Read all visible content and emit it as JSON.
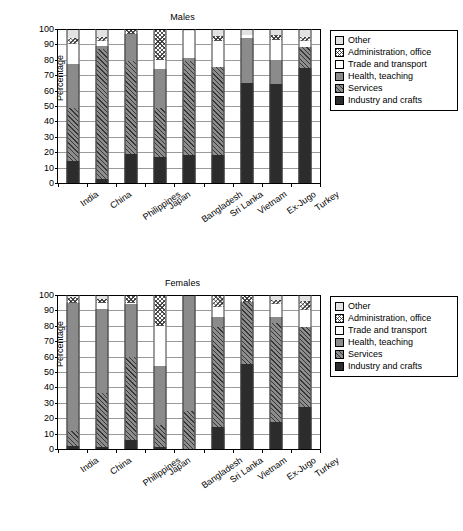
{
  "figure": {
    "width": 463,
    "height": 531
  },
  "legend": {
    "position": "right",
    "items": [
      {
        "label": "Other",
        "key": "other",
        "swatch": "other-swatch"
      },
      {
        "label": "Administration, office",
        "key": "admin",
        "swatch": "admin-swatch"
      },
      {
        "label": "Trade and transport",
        "key": "trade",
        "swatch": "trade-swatch"
      },
      {
        "label": "Health, teaching",
        "key": "health",
        "swatch": "health-swatch"
      },
      {
        "label": "Services",
        "key": "services",
        "swatch": "services-swatch"
      },
      {
        "label": "Industry and crafts",
        "key": "industry",
        "swatch": "industry-swatch"
      }
    ]
  },
  "axis": {
    "ylabel": "Percentage",
    "yticks": [
      0,
      10,
      20,
      30,
      40,
      50,
      60,
      70,
      80,
      90,
      100
    ],
    "ylim": [
      0,
      100
    ],
    "grid": true
  },
  "colors": {
    "industry": "#2c2c2c",
    "services": "#8d8d8d",
    "health": "#8b8b8b",
    "trade": "#ffffff",
    "admin": "#ffffff",
    "other": "#e2e2e2",
    "axis": "#000000",
    "grid": "#9a9a9a"
  },
  "chart_data": [
    {
      "type": "bar",
      "stacked": true,
      "title": "Males",
      "xlabel": "",
      "ylabel": "Percentage",
      "ylim": [
        0,
        100
      ],
      "grid": true,
      "legend_position": "right",
      "categories": [
        "India",
        "China",
        "Philippines",
        "Japan",
        "Bangladesh",
        "Sri Lanka",
        "Vietnam",
        "Ex-Jugo",
        "Turkey"
      ],
      "series": [
        {
          "name": "Industry and crafts",
          "values": [
            14,
            2.5,
            19,
            17,
            18,
            18,
            65,
            64,
            75
          ]
        },
        {
          "name": "Services",
          "values": [
            35,
            84.5,
            60,
            32,
            61,
            57.5,
            0,
            0,
            13
          ]
        },
        {
          "name": "Health, teaching",
          "values": [
            28,
            2,
            18,
            25,
            2,
            0,
            29,
            16,
            0
          ]
        },
        {
          "name": "Trade and transport",
          "values": [
            13,
            3,
            0,
            6,
            18,
            17,
            2,
            13,
            4
          ]
        },
        {
          "name": "Administration, office",
          "values": [
            4,
            3,
            3,
            20,
            0,
            3,
            0,
            3,
            3
          ]
        },
        {
          "name": "Other",
          "values": [
            6,
            5,
            0,
            0,
            1,
            4.5,
            4,
            4,
            5
          ]
        }
      ],
      "cumulative_tops": {
        "India": [
          14,
          49,
          77,
          90,
          94,
          100
        ],
        "China": [
          2.5,
          87,
          89,
          92,
          95,
          100
        ],
        "Philippines": [
          19,
          79,
          97,
          97,
          100,
          100
        ],
        "Japan": [
          17,
          49,
          74,
          80,
          100,
          100
        ],
        "Bangladesh": [
          18,
          79,
          81,
          99,
          99,
          100
        ],
        "Sri Lanka": [
          18,
          75.5,
          75.5,
          92.5,
          95.5,
          100
        ],
        "Vietnam": [
          65,
          65,
          94,
          96,
          96,
          100
        ],
        "Ex-Jugo": [
          64,
          64,
          80,
          93,
          96,
          100
        ],
        "Turkey": [
          75,
          88,
          88,
          92,
          95,
          100
        ]
      }
    },
    {
      "type": "bar",
      "stacked": true,
      "title": "Females",
      "xlabel": "",
      "ylabel": "Percentage",
      "ylim": [
        0,
        100
      ],
      "grid": true,
      "legend_position": "right",
      "categories": [
        "India",
        "China",
        "Philippines",
        "Japan",
        "Bangladesh",
        "Sri Lanka",
        "Vietnam",
        "Ex-Jugo",
        "Turkey"
      ],
      "series": [
        {
          "name": "Industry and crafts",
          "values": [
            2,
            1,
            6,
            1.5,
            0,
            14.5,
            55,
            17.5,
            27
          ]
        },
        {
          "name": "Services",
          "values": [
            9.5,
            35.5,
            54,
            14,
            24.5,
            64.5,
            40.5,
            64.5,
            52
          ]
        },
        {
          "name": "Health, teaching",
          "values": [
            83.5,
            54.5,
            34,
            38.5,
            75.5,
            7,
            0,
            4,
            0
          ]
        },
        {
          "name": "Trade and transport",
          "values": [
            0,
            4,
            1,
            26,
            0,
            6,
            0,
            8,
            11
          ]
        },
        {
          "name": "Administration, office",
          "values": [
            3.5,
            2.5,
            5,
            20,
            0,
            8,
            4.5,
            3,
            6
          ]
        },
        {
          "name": "Other",
          "values": [
            1.5,
            2.5,
            0,
            0,
            0,
            0,
            0,
            3,
            4
          ]
        }
      ],
      "cumulative_tops": {
        "India": [
          2,
          11.5,
          95,
          95,
          98.5,
          100
        ],
        "China": [
          1,
          36.5,
          91,
          95,
          97.5,
          100
        ],
        "Philippines": [
          6,
          60,
          94,
          95,
          100,
          100
        ],
        "Japan": [
          1.5,
          15.5,
          54,
          80,
          100,
          100
        ],
        "Bangladesh": [
          0,
          24.5,
          100,
          100,
          100,
          100
        ],
        "Sri Lanka": [
          14.5,
          79,
          86,
          92,
          100,
          100
        ],
        "Vietnam": [
          55,
          95.5,
          95.5,
          95.5,
          100,
          100
        ],
        "Ex-Jugo": [
          17.5,
          82,
          86,
          94,
          97,
          100
        ],
        "Turkey": [
          27,
          79,
          79,
          90,
          96,
          100
        ]
      }
    }
  ]
}
